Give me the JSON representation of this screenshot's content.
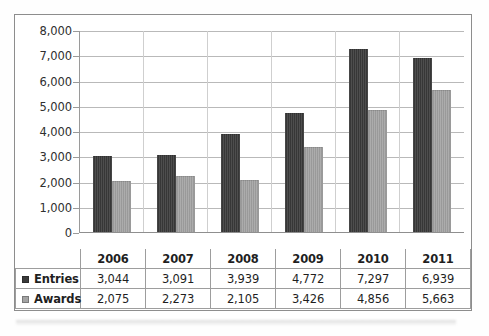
{
  "chart_data": {
    "type": "bar",
    "title": "",
    "subtitle": "",
    "xlabel": "",
    "ylabel": "",
    "categories": [
      "2006",
      "2007",
      "2008",
      "2009",
      "2010",
      "2011"
    ],
    "series": [
      {
        "name": "Entries",
        "color": "#3a3a3a",
        "values": [
          3044,
          3091,
          3939,
          4772,
          7297,
          6939
        ]
      },
      {
        "name": "Awards",
        "color": "#a3a3a3",
        "values": [
          2075,
          2273,
          2105,
          3426,
          4856,
          5663
        ]
      }
    ],
    "ylim": [
      0,
      8000
    ],
    "ytick_step": 1000,
    "ytick_labels": [
      "8,000",
      "7,000",
      "6,000",
      "5,000",
      "4,000",
      "3,000",
      "2,000",
      "1,000",
      "0"
    ],
    "grid": true,
    "legend_position": "data-table-left",
    "data_table_visible": true,
    "annotations": []
  },
  "table": {
    "header_row": [
      "",
      "2006",
      "2007",
      "2008",
      "2009",
      "2010",
      "2011"
    ],
    "rows": [
      {
        "label": "Entries",
        "swatch": "entries-swatch",
        "values": [
          "3,044",
          "3,091",
          "3,939",
          "4,772",
          "7,297",
          "6,939"
        ]
      },
      {
        "label": "Awards",
        "swatch": "awards-swatch",
        "values": [
          "2,075",
          "2,273",
          "2,105",
          "3,426",
          "4,856",
          "5,663"
        ]
      }
    ]
  },
  "colors": {
    "entries": "#3a3a3a",
    "awards": "#a3a3a3",
    "gridline": "#b9b9b9",
    "axis": "#8f8f8f",
    "frame": "#8d8d8d",
    "text": "#1f1f1f",
    "background": "#ffffff"
  }
}
